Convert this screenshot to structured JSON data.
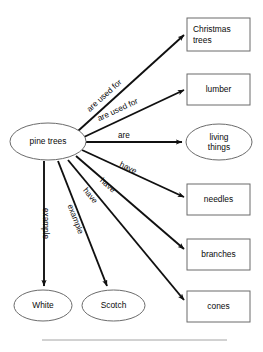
{
  "diagram": {
    "type": "concept-map",
    "title_text": "",
    "root": "pine trees",
    "nodes": [
      {
        "id": "pine-trees",
        "label": "pine trees",
        "shape": "ellipse",
        "x": 10,
        "y": 123,
        "w": 76,
        "h": 37,
        "align": "center"
      },
      {
        "id": "christmas-trees",
        "label": "Christmas\ntrees",
        "shape": "rect",
        "x": 187,
        "y": 18,
        "w": 63,
        "h": 33,
        "align": "left"
      },
      {
        "id": "lumber",
        "label": "lumber",
        "shape": "rect",
        "x": 187,
        "y": 74,
        "w": 63,
        "h": 31,
        "align": "center"
      },
      {
        "id": "living-things",
        "label": "living\nthings",
        "shape": "ellipse",
        "x": 186,
        "y": 124,
        "w": 66,
        "h": 36,
        "align": "center"
      },
      {
        "id": "needles",
        "label": "needles",
        "shape": "rect",
        "x": 187,
        "y": 184,
        "w": 63,
        "h": 31,
        "align": "center"
      },
      {
        "id": "branches",
        "label": "branches",
        "shape": "rect",
        "x": 187,
        "y": 239,
        "w": 63,
        "h": 31,
        "align": "center"
      },
      {
        "id": "cones",
        "label": "cones",
        "shape": "rect",
        "x": 187,
        "y": 291,
        "w": 63,
        "h": 31,
        "align": "center"
      },
      {
        "id": "white",
        "label": "White",
        "shape": "ellipse",
        "x": 14,
        "y": 290,
        "w": 58,
        "h": 31,
        "align": "center"
      },
      {
        "id": "scotch",
        "label": "Scotch",
        "shape": "ellipse",
        "x": 82,
        "y": 290,
        "w": 63,
        "h": 31,
        "align": "center"
      }
    ],
    "edges": [
      {
        "id": "edge-christmas-trees",
        "from": "pine-trees",
        "to": "christmas-trees",
        "label": "are used for",
        "x1": 78,
        "y1": 131,
        "x2": 184,
        "y2": 35,
        "label_x": 85,
        "label_y": 107,
        "label_angle": -42
      },
      {
        "id": "edge-lumber",
        "from": "pine-trees",
        "to": "lumber",
        "label": "are used for",
        "x1": 84,
        "y1": 137,
        "x2": 184,
        "y2": 90,
        "label_x": 96,
        "label_y": 115,
        "label_angle": -25
      },
      {
        "id": "edge-living-things",
        "from": "pine-trees",
        "to": "living-things",
        "label": "are",
        "x1": 86,
        "y1": 142,
        "x2": 182,
        "y2": 142,
        "label_x": 118,
        "label_y": 131,
        "label_angle": 0
      },
      {
        "id": "edge-needles",
        "from": "pine-trees",
        "to": "needles",
        "label": "have",
        "x1": 82,
        "y1": 150,
        "x2": 184,
        "y2": 197,
        "label_x": 122,
        "label_y": 160,
        "label_angle": 25
      },
      {
        "id": "edge-branches",
        "from": "pine-trees",
        "to": "branches",
        "label": "have",
        "x1": 76,
        "y1": 156,
        "x2": 184,
        "y2": 249,
        "label_x": 104,
        "label_y": 176,
        "label_angle": 41
      },
      {
        "id": "edge-cones",
        "from": "pine-trees",
        "to": "cones",
        "label": "have",
        "x1": 68,
        "y1": 160,
        "x2": 184,
        "y2": 300,
        "label_x": 88,
        "label_y": 186,
        "label_angle": 50
      },
      {
        "id": "edge-scotch",
        "from": "pine-trees",
        "to": "scotch",
        "label": "example",
        "x1": 58,
        "y1": 161,
        "x2": 107,
        "y2": 286,
        "label_x": 74,
        "label_y": 203,
        "label_angle": 69
      },
      {
        "id": "edge-white",
        "from": "pine-trees",
        "to": "white",
        "label": "example",
        "x1": 44,
        "y1": 161,
        "x2": 44,
        "y2": 286,
        "label_x": 50,
        "label_y": 208,
        "label_angle": 90
      }
    ],
    "footer_rule": {
      "x1": 42,
      "y1": 340,
      "x2": 227,
      "y2": 340
    }
  },
  "style": {
    "stroke": "#101010",
    "node_stroke": "#6b6b6b",
    "node_fill": "#ffffff",
    "rule_color": "#9a9a9a",
    "background": "#ffffff"
  }
}
